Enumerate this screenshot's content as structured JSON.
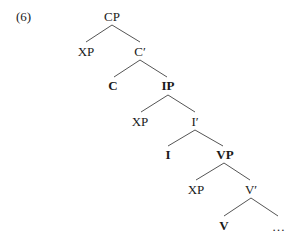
{
  "example_number": "(6)",
  "tree": {
    "root": "CP",
    "nodes": [
      {
        "id": "cp",
        "label": "CP",
        "bold": false,
        "x": 112,
        "y": 17
      },
      {
        "id": "xp1",
        "label": "XP",
        "bold": false,
        "x": 86,
        "y": 52
      },
      {
        "id": "cbar",
        "label": "C′",
        "bold": false,
        "x": 140,
        "y": 52
      },
      {
        "id": "c",
        "label": "C",
        "bold": true,
        "x": 113,
        "y": 86
      },
      {
        "id": "ip",
        "label": "IP",
        "bold": true,
        "x": 168,
        "y": 86
      },
      {
        "id": "xp2",
        "label": "XP",
        "bold": false,
        "x": 140,
        "y": 122
      },
      {
        "id": "ibar",
        "label": "I′",
        "bold": false,
        "x": 195,
        "y": 122
      },
      {
        "id": "i",
        "label": "I",
        "bold": true,
        "x": 168,
        "y": 155
      },
      {
        "id": "vp",
        "label": "VP",
        "bold": true,
        "x": 225,
        "y": 155
      },
      {
        "id": "xp3",
        "label": "XP",
        "bold": false,
        "x": 196,
        "y": 190
      },
      {
        "id": "vbar",
        "label": "V′",
        "bold": false,
        "x": 251,
        "y": 190
      },
      {
        "id": "v",
        "label": "V",
        "bold": true,
        "x": 224,
        "y": 226
      },
      {
        "id": "ellipsis",
        "label": "…",
        "bold": false,
        "x": 279,
        "y": 227
      }
    ],
    "edges": [
      [
        "cp",
        "xp1"
      ],
      [
        "cp",
        "cbar"
      ],
      [
        "cbar",
        "c"
      ],
      [
        "cbar",
        "ip"
      ],
      [
        "ip",
        "xp2"
      ],
      [
        "ip",
        "ibar"
      ],
      [
        "ibar",
        "i"
      ],
      [
        "ibar",
        "vp"
      ],
      [
        "vp",
        "xp3"
      ],
      [
        "vp",
        "vbar"
      ],
      [
        "vbar",
        "v"
      ],
      [
        "vbar",
        "ellipsis"
      ]
    ]
  },
  "colors": {
    "text": "#1a1a1a",
    "line": "#555555",
    "background": "#ffffff"
  }
}
